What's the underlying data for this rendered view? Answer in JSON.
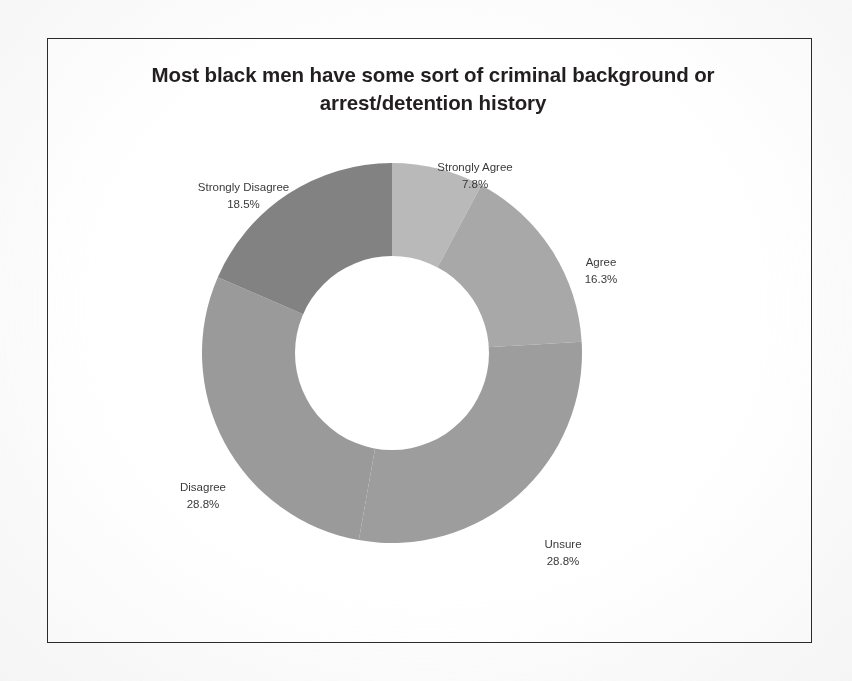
{
  "chart_data": {
    "type": "pie",
    "variant": "donut",
    "title": "Most black men have some sort of criminal background or arrest/detention history",
    "categories": [
      "Strongly Agree",
      "Agree",
      "Unsure",
      "Disagree",
      "Strongly Disagree"
    ],
    "values": [
      7.8,
      16.3,
      28.8,
      28.8,
      18.5
    ],
    "value_suffix": "%",
    "labels": [
      {
        "name": "Strongly Agree",
        "value": "7.8%",
        "color": "#b9b9b9"
      },
      {
        "name": "Agree",
        "value": "16.3%",
        "color": "#a8a8a8"
      },
      {
        "name": "Unsure",
        "value": "28.8%",
        "color": "#9d9d9d"
      },
      {
        "name": "Disagree",
        "value": "28.8%",
        "color": "#9a9a9a"
      },
      {
        "name": "Strongly Disagree",
        "value": "18.5%",
        "color": "#828282"
      }
    ],
    "legend": "none",
    "data_labels": "outside",
    "start_angle_deg": 0,
    "direction": "clockwise",
    "inner_radius_ratio": 0.515,
    "xlabel": "",
    "ylabel": ""
  },
  "frame": {
    "border_color": "#2b2b2b",
    "background": "#ffffff"
  },
  "page": {
    "background": "#fdfdfd"
  }
}
